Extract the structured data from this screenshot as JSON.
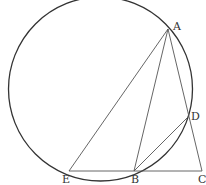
{
  "diagram": {
    "circle": {
      "cx": 100.5,
      "cy": 89,
      "r": 92
    },
    "points": {
      "A": {
        "label": "A",
        "x": 168,
        "y": 29,
        "lx": 173,
        "ly": 30
      },
      "B": {
        "label": "B",
        "x": 134,
        "y": 171,
        "lx": 131,
        "ly": 183
      },
      "C": {
        "label": "C",
        "x": 202,
        "y": 171,
        "lx": 198,
        "ly": 183
      },
      "D": {
        "label": "D",
        "x": 189,
        "y": 116,
        "lx": 191,
        "ly": 120
      },
      "E": {
        "label": "E",
        "x": 69,
        "y": 171,
        "lx": 62,
        "ly": 183
      }
    },
    "segments": [
      [
        "A",
        "E"
      ],
      [
        "A",
        "B"
      ],
      [
        "A",
        "C"
      ],
      [
        "E",
        "C"
      ],
      [
        "B",
        "D"
      ]
    ],
    "colors": {
      "stroke": "#555555",
      "circle": "#333333",
      "text": "#333333"
    }
  }
}
